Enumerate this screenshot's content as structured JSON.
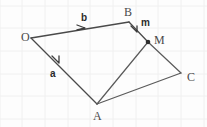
{
  "figure": {
    "background_color": "#fdfdfd",
    "grid": {
      "visible": true,
      "color": "#f0f0f0",
      "spacing_px": 22.5
    },
    "line_color": "#5a5a5a",
    "label_color": "#4a4a4a",
    "points": [
      {
        "id": "O",
        "label": "O",
        "x": 31,
        "y": 38,
        "label_x": 21,
        "label_y": 41,
        "dot": false
      },
      {
        "id": "B",
        "label": "B",
        "x": 129,
        "y": 22,
        "label_x": 124,
        "label_y": 16,
        "dot": false
      },
      {
        "id": "M",
        "label": "M",
        "x": 148,
        "y": 42,
        "label_x": 154,
        "label_y": 44,
        "dot": true
      },
      {
        "id": "C",
        "label": "C",
        "x": 181,
        "y": 73,
        "label_x": 187,
        "label_y": 81,
        "dot": false
      },
      {
        "id": "A",
        "label": "A",
        "x": 97,
        "y": 104,
        "label_x": 93,
        "label_y": 120,
        "dot": false
      }
    ],
    "edges": [
      {
        "id": "edge-O-B",
        "from": "O",
        "to": "B",
        "type": "vector",
        "label": "b"
      },
      {
        "id": "edge-O-A",
        "from": "O",
        "to": "A",
        "type": "vector",
        "label": "a"
      },
      {
        "id": "edge-B-M",
        "from": "B",
        "to": "M",
        "type": "vector",
        "label": "m"
      },
      {
        "id": "edge-M-C",
        "from": "M",
        "to": "C",
        "type": "plain",
        "label": ""
      },
      {
        "id": "edge-A-M",
        "from": "A",
        "to": "M",
        "type": "plain",
        "label": ""
      },
      {
        "id": "edge-A-C",
        "from": "A",
        "to": "C",
        "type": "plain",
        "label": ""
      }
    ],
    "vector_labels": [
      {
        "id": "label-b",
        "text": "b",
        "x": 81,
        "y": 21
      },
      {
        "id": "label-a",
        "text": "a",
        "x": 50,
        "y": 77
      },
      {
        "id": "label-m",
        "text": "m",
        "x": 141,
        "y": 26
      }
    ]
  }
}
